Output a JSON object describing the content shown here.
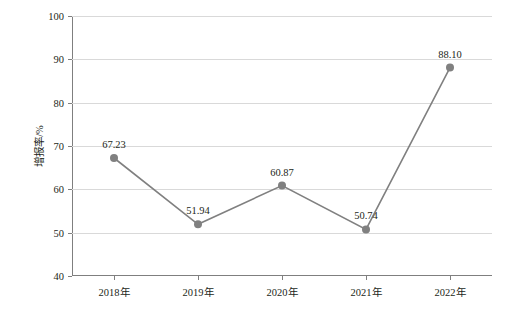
{
  "chart_data": {
    "type": "line",
    "title": "",
    "xlabel": "",
    "ylabel": "增报率/%",
    "categories": [
      "2018年",
      "2019年",
      "2020年",
      "2021年",
      "2022年"
    ],
    "values": [
      67.23,
      51.94,
      60.87,
      50.74,
      88.1
    ],
    "point_labels": [
      "67.23",
      "51.94",
      "60.87",
      "50.74",
      "88.10"
    ],
    "ylim": [
      40,
      100
    ],
    "yticks": [
      "40",
      "50",
      "60",
      "70",
      "80",
      "90",
      "100"
    ],
    "ytick_values": [
      40,
      50,
      60,
      70,
      80,
      90,
      100
    ],
    "grid": true,
    "legend": "none",
    "series_color": "#808080",
    "grid_color": "#d9d9d9",
    "axis_color": "#7f7f7f",
    "text_color": "#231f20"
  }
}
